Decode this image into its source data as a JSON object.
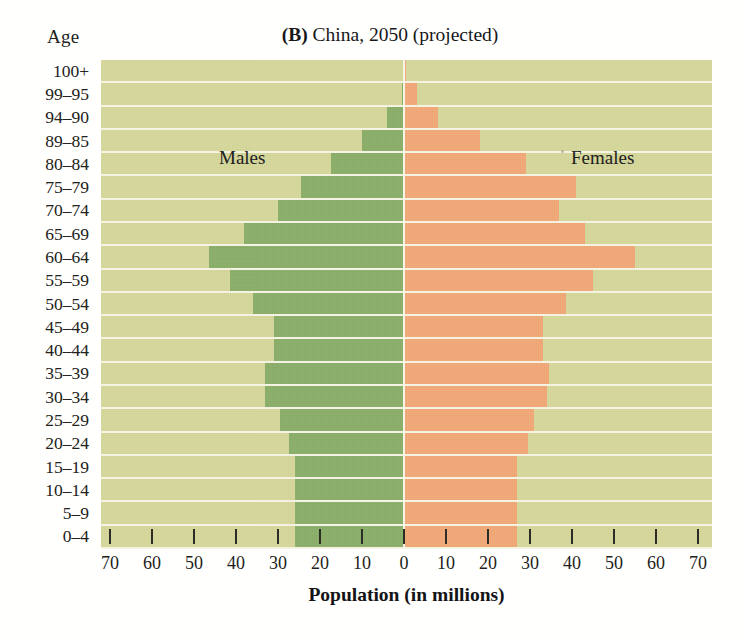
{
  "header": {
    "age_axis_label": "Age",
    "panel_letter": "(B)",
    "title_rest": " China, 2050 (projected)",
    "title_full": "(B) China, 2050 (projected)"
  },
  "legend": {
    "males": "Males",
    "females": "Females"
  },
  "axis": {
    "x_title": "Population (in millions)",
    "x_ticks": [
      "70",
      "60",
      "50",
      "40",
      "30",
      "20",
      "10",
      "0",
      "10",
      "20",
      "30",
      "40",
      "50",
      "60",
      "70"
    ]
  },
  "colors": {
    "plot_background": "#d5d79a",
    "male_bar": "#8aae69",
    "female_bar": "#f2a877",
    "gridline": "#f7f6e4",
    "text": "#1a1a18"
  },
  "chart_data": {
    "type": "bar",
    "subtype": "population-pyramid",
    "title": "(B) China, 2050 (projected)",
    "xlabel": "Population (in millions)",
    "ylabel": "Age",
    "xlim": [
      -70,
      70
    ],
    "x_tick_values": [
      70,
      60,
      50,
      40,
      30,
      20,
      10,
      0,
      10,
      20,
      30,
      40,
      50,
      60,
      70
    ],
    "grid": true,
    "legend_position": "inside-top",
    "categories": [
      "100+",
      "99–95",
      "94–90",
      "89–85",
      "80–84",
      "75–79",
      "70–74",
      "65–69",
      "60–64",
      "55–59",
      "50–54",
      "45–49",
      "40–44",
      "35–39",
      "30–34",
      "25–29",
      "20–24",
      "15–19",
      "10–14",
      "5–9",
      "0–4"
    ],
    "series": [
      {
        "name": "Males",
        "direction": "left",
        "color": "#8aae69",
        "values": [
          0,
          0.5,
          4,
          10,
          17.5,
          24.5,
          30,
          38,
          46.5,
          41.5,
          36,
          31,
          31,
          33,
          33,
          29.5,
          27.5,
          26,
          26,
          26,
          26
        ]
      },
      {
        "name": "Females",
        "direction": "right",
        "color": "#f2a877",
        "values": [
          0.5,
          3,
          8,
          18,
          29,
          41,
          37,
          43,
          55,
          45,
          38.5,
          33,
          33,
          34.5,
          34,
          31,
          29.5,
          27,
          27,
          27,
          27
        ]
      }
    ]
  }
}
